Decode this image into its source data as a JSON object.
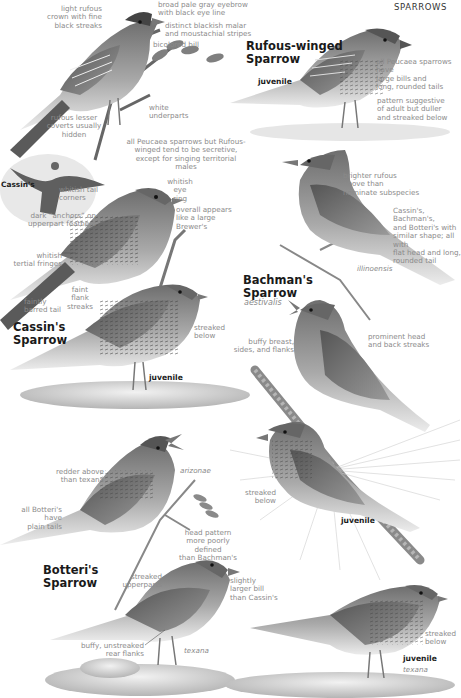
{
  "header": {
    "section": "SPARROWS"
  },
  "species": [
    {
      "name": "Rufous-winged\nSparrow",
      "labels": {
        "juvenile": "juvenile"
      },
      "annotations": {
        "crown": "light rufous\ncrown with fine\nblack streaks",
        "eyebrow": "broad pale gray eyebrow\nwith black eye line",
        "malar": "distinct blackish malar\nand moustachial stripes",
        "bill": "bicolored bill",
        "underparts": "white\nunderparts",
        "coverts": "rufous lesser\ncoverts usually\nhidden",
        "peucaea_bills": "all Peucaea sparrows have\nlarge bills and\nlong, rounded tails",
        "juvenile_pattern": "pattern suggestive\nof adult but duller\nand streaked below",
        "secretive": "all Peucaea sparrows but Rufous-\nwinged tend to be secretive,\nexcept for singing territorial males"
      }
    },
    {
      "name": "Cassin's\nSparrow",
      "flight_label": "Cassin's",
      "labels": {
        "juvenile": "juvenile"
      },
      "annotations": {
        "tail_corners": "whitish tail\ncorners",
        "eye_ring": "whitish eye\nring",
        "anchors": "dark “anchors” on\nupperpart feathers",
        "overall": "overall appears\nlike a large\nBrewer's",
        "tertials": "whitish\ntertial fringes",
        "flank": "faint flank\nstreaks",
        "tail": "faintly\nbarred tail",
        "streaked_below": "streaked\nbelow"
      }
    },
    {
      "name": "Bachman's\nSparrow",
      "subspecies": "aestivalis",
      "subspecies_illinoensis": "illinoensis",
      "labels": {
        "juvenile": "juvenile"
      },
      "annotations": {
        "brighter": "brighter rufous\nabove than\nnominate subspecies",
        "shape": "Cassin's, Bachman's,\nand Botteri's with\nsimilar shape; all with\nflat head and long,\nrounded tail",
        "buffy_breast": "buffy breast,\nsides, and flanks",
        "head_streaks": "prominent head\nand back streaks",
        "streaked_below": "streaked\nbelow"
      }
    },
    {
      "name": "Botteri's\nSparrow",
      "subspecies_arizonae": "arizonae",
      "subspecies_texana": "texana",
      "labels": {
        "juvenile": "juvenile",
        "juvenile_ssp": "texana"
      },
      "annotations": {
        "redder": "redder above\nthan texana",
        "plain_tails": "all Botteri's have\nplain tails",
        "head_pattern": "head pattern\nmore poorly defined\nthan Bachman's",
        "upperparts": "streaked\nupperparts",
        "larger_bill": "slightly\nlarger bill\nthan Cassin's",
        "rear_flanks": "buffy, unstreaked\nrear flanks",
        "streaked_below": "streaked\nbelow"
      }
    }
  ],
  "colors": {
    "ink": "#1a1a1a",
    "annotation": "#8a8a8a",
    "bird_dark": "#3a3a3a",
    "bird_mid": "#8c8c8c",
    "bird_light": "#d9d9d9",
    "ground": "#c8c8c8"
  }
}
